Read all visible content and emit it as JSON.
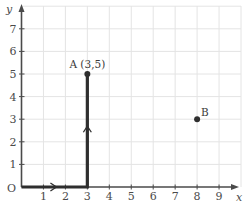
{
  "chart_data": {
    "type": "line",
    "title": "",
    "xlabel": "x",
    "ylabel": "y",
    "origin_label": "O",
    "xlim": [
      0,
      10
    ],
    "ylim": [
      0,
      8
    ],
    "grid": true,
    "x_ticks": [
      "1",
      "2",
      "3",
      "4",
      "5",
      "6",
      "7",
      "8",
      "9"
    ],
    "y_ticks": [
      "1",
      "2",
      "3",
      "4",
      "5",
      "6",
      "7"
    ],
    "path": {
      "name": "path O to A",
      "points": [
        [
          0,
          0
        ],
        [
          3,
          0
        ],
        [
          3,
          5
        ]
      ],
      "direction_arrows": [
        [
          1.5,
          0,
          "right"
        ],
        [
          3,
          2.6,
          "up"
        ]
      ]
    },
    "points": [
      {
        "name": "A",
        "label": "A (3,5)",
        "x": 3,
        "y": 5
      },
      {
        "name": "B",
        "label": "B",
        "x": 8,
        "y": 3
      }
    ],
    "colors": {
      "axis": "#4a4a4a",
      "path": "#2e2e2e",
      "grid": "#e4e4e4",
      "point": "#2e2e2e"
    }
  }
}
